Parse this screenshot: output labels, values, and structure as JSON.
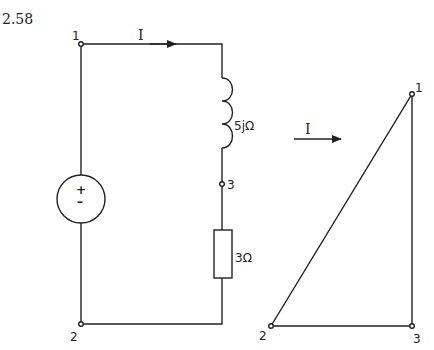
{
  "problem_number": "2.58",
  "circuit": {
    "current_label": "I",
    "inductor_label": "5jΩ",
    "resistor_label": "3Ω",
    "source_plus": "+",
    "source_minus": "–",
    "nodes": {
      "n1": "1",
      "n2": "2",
      "n3": "3"
    }
  },
  "phasor": {
    "current_label": "I",
    "nodes": {
      "n1": "1",
      "n2": "2",
      "n3": "3"
    }
  }
}
